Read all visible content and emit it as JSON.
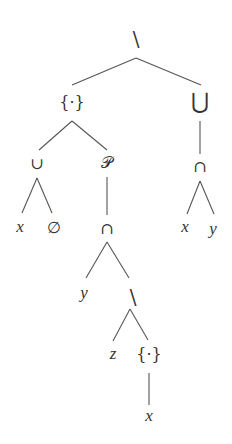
{
  "diagram": {
    "type": "expression-tree",
    "nodes": [
      {
        "id": "n0",
        "label": "\\",
        "x": 136,
        "y": 40,
        "size": 20,
        "italic": false
      },
      {
        "id": "n1",
        "label": "{·}",
        "x": 72,
        "y": 103,
        "size": 16,
        "italic": false
      },
      {
        "id": "n2",
        "label": "⋃",
        "x": 200,
        "y": 103,
        "size": 22,
        "italic": false
      },
      {
        "id": "n3",
        "label": "∪",
        "x": 37,
        "y": 164,
        "size": 16,
        "italic": false
      },
      {
        "id": "n4",
        "label": "𝒫",
        "x": 107,
        "y": 163,
        "size": 16,
        "italic": false
      },
      {
        "id": "n5",
        "label": "∩",
        "x": 200,
        "y": 167,
        "size": 16,
        "italic": false
      },
      {
        "id": "n6",
        "label": "x",
        "x": 20,
        "y": 228,
        "size": 17,
        "italic": true
      },
      {
        "id": "n7",
        "label": "∅",
        "x": 54,
        "y": 228,
        "size": 16,
        "italic": false
      },
      {
        "id": "n8",
        "label": "∩",
        "x": 107,
        "y": 229,
        "size": 16,
        "italic": false
      },
      {
        "id": "n9",
        "label": "x",
        "x": 185,
        "y": 228,
        "size": 17,
        "italic": true
      },
      {
        "id": "n10",
        "label": "y",
        "x": 213,
        "y": 230,
        "size": 17,
        "italic": true
      },
      {
        "id": "n11",
        "label": "y",
        "x": 84,
        "y": 294,
        "size": 17,
        "italic": true
      },
      {
        "id": "n12",
        "label": "\\",
        "x": 133,
        "y": 298,
        "size": 20,
        "italic": false
      },
      {
        "id": "n13",
        "label": "z",
        "x": 113,
        "y": 355,
        "size": 17,
        "italic": true
      },
      {
        "id": "n14",
        "label": "{·}",
        "x": 149,
        "y": 355,
        "size": 16,
        "italic": false
      },
      {
        "id": "n15",
        "label": "x",
        "x": 149,
        "y": 417,
        "size": 17,
        "italic": true
      }
    ],
    "edges": [
      {
        "x1": 136,
        "y1": 58,
        "x2": 72,
        "y2": 85
      },
      {
        "x1": 136,
        "y1": 58,
        "x2": 201,
        "y2": 85
      },
      {
        "x1": 72,
        "y1": 121,
        "x2": 39,
        "y2": 150
      },
      {
        "x1": 72,
        "y1": 121,
        "x2": 107,
        "y2": 150
      },
      {
        "x1": 200,
        "y1": 121,
        "x2": 200,
        "y2": 154
      },
      {
        "x1": 37,
        "y1": 178,
        "x2": 22,
        "y2": 213
      },
      {
        "x1": 37,
        "y1": 178,
        "x2": 52,
        "y2": 213
      },
      {
        "x1": 107,
        "y1": 177,
        "x2": 107,
        "y2": 215
      },
      {
        "x1": 200,
        "y1": 181,
        "x2": 187,
        "y2": 214
      },
      {
        "x1": 200,
        "y1": 181,
        "x2": 214,
        "y2": 214
      },
      {
        "x1": 107,
        "y1": 242,
        "x2": 86,
        "y2": 278
      },
      {
        "x1": 107,
        "y1": 242,
        "x2": 129,
        "y2": 278
      },
      {
        "x1": 130,
        "y1": 309,
        "x2": 113,
        "y2": 341
      },
      {
        "x1": 130,
        "y1": 309,
        "x2": 148,
        "y2": 340
      },
      {
        "x1": 149,
        "y1": 373,
        "x2": 149,
        "y2": 405
      }
    ]
  }
}
